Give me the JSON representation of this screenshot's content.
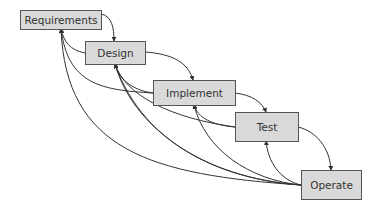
{
  "colors": {
    "box_fill": "#d9d9d9",
    "box_border": "#555555",
    "line": "#333333",
    "text": "#333333"
  },
  "nodes": [
    {
      "id": "requirements",
      "label": "Requirements",
      "x": 20,
      "y": 10,
      "w": 82,
      "h": 20
    },
    {
      "id": "design",
      "label": "Design",
      "x": 85,
      "y": 41,
      "w": 61,
      "h": 24
    },
    {
      "id": "implement",
      "label": "Implement",
      "x": 153,
      "y": 80,
      "w": 83,
      "h": 26
    },
    {
      "id": "test",
      "label": "Test",
      "x": 235,
      "y": 112,
      "w": 64,
      "h": 30
    },
    {
      "id": "operate",
      "label": "Operate",
      "x": 301,
      "y": 170,
      "w": 61,
      "h": 30
    }
  ],
  "edges": [
    {
      "from": "requirements",
      "to": "design",
      "kind": "forward",
      "d": "M101 14 C112 16 114 28 114 41"
    },
    {
      "from": "design",
      "to": "implement",
      "kind": "forward",
      "d": "M145 52 C172 54 188 62 193 80"
    },
    {
      "from": "implement",
      "to": "test",
      "kind": "forward",
      "d": "M235 93 C252 95 262 102 266 112"
    },
    {
      "from": "test",
      "to": "operate",
      "kind": "forward",
      "d": "M298 127 C316 131 330 148 331 170"
    },
    {
      "from": "design",
      "to": "requirements",
      "kind": "feedback",
      "d": "M85 53 C70 50 64 42 61 29"
    },
    {
      "from": "implement",
      "to": "requirements",
      "kind": "feedback",
      "d": "M153 93 C100 90 68 84 61 29"
    },
    {
      "from": "operate",
      "to": "requirements",
      "kind": "feedback",
      "d": "M301 185 C150 175 66 150 61 29"
    },
    {
      "from": "implement",
      "to": "design",
      "kind": "feedback",
      "d": "M153 93 C132 90 120 80 115 64"
    },
    {
      "from": "test",
      "to": "design",
      "kind": "feedback",
      "d": "M235 127 C170 118 125 95 115 64"
    },
    {
      "from": "operate",
      "to": "design",
      "kind": "feedback",
      "d": "M301 185 C200 178 132 125 115 64"
    },
    {
      "from": "operate",
      "to": "design",
      "kind": "feedback",
      "d": "M301 185 C230 180 145 150 115 64"
    },
    {
      "from": "test",
      "to": "implement",
      "kind": "feedback",
      "d": "M235 127 C212 125 198 118 194 105"
    },
    {
      "from": "operate",
      "to": "implement",
      "kind": "feedback",
      "d": "M301 185 C250 180 205 150 194 105"
    },
    {
      "from": "operate",
      "to": "test",
      "kind": "feedback",
      "d": "M301 185 C280 180 268 162 266 141"
    }
  ]
}
